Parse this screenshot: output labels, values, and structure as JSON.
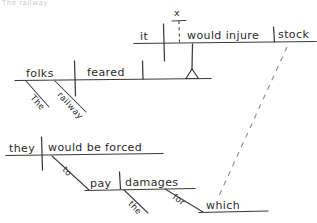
{
  "page": {
    "background_color": "#ffffff",
    "ink_color": "#39393d",
    "faint_ink_color": "#8d8d96",
    "width": 317,
    "height": 223
  },
  "header": {
    "clipped_text": "The railway"
  },
  "sentence": {
    "text": "The railway folks feared it would injure stock for which they would be forced to pay damages."
  },
  "diagram": {
    "type": "reed-kellogg-sentence-diagram",
    "clauses": [
      {
        "id": "main-clause",
        "subject": "folks",
        "verb": "feared",
        "modifiers": [
          {
            "word": "The",
            "attaches_to": "folks"
          },
          {
            "word": "railway",
            "attaches_to": "folks"
          }
        ],
        "object": "noun-clause-pedestal"
      },
      {
        "id": "noun-clause",
        "conjunction": "x",
        "conjunction_note": "omitted subordinator shown as x on dashed line",
        "subject": "it",
        "verb": "would injure",
        "object": "stock"
      },
      {
        "id": "relative-clause",
        "subject": "they",
        "verb": "would be forced",
        "infinitive": "to",
        "infinitive_verb": "pay",
        "infinitive_object": "damages",
        "infinitive_object_modifier": "the",
        "preposition": "for",
        "preposition_object": "which",
        "refers_to": "stock"
      }
    ],
    "labels": {
      "folks": "folks",
      "feared": "feared",
      "the_subject_mod": "The",
      "railway": "railway",
      "it": "it",
      "would_injure": "would injure",
      "stock": "stock",
      "x_marker": "x",
      "they": "they",
      "would_be_forced": "would be forced",
      "to": "to",
      "pay": "pay",
      "damages": "damages",
      "the_object_mod": "the",
      "for": "for",
      "which": "which"
    },
    "connector": {
      "style": "dashed",
      "from": "stock",
      "to": "which",
      "meaning": "relative pronoun reference line"
    }
  }
}
